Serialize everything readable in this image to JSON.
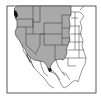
{
  "map": {
    "type": "range-map",
    "region": "Western North America",
    "colors": {
      "background": "#ffffff",
      "range_fill": "#a9a9a9",
      "land_fill": "#ffffff",
      "border": "#222222",
      "water_dark": "#111111"
    },
    "shaded_region": [
      "Washington",
      "Oregon",
      "California",
      "Nevada",
      "Idaho",
      "Montana",
      "Wyoming",
      "Utah",
      "Colorado",
      "Arizona",
      "New Mexico",
      "North Dakota (west)",
      "South Dakota (west)",
      "Nebraska (west)",
      "Kansas (west)",
      "Northern Mexico (Sonora/Chihuahua border)"
    ]
  }
}
